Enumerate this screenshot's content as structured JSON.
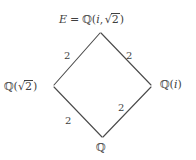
{
  "diagram": {
    "kind": "hasse-lattice",
    "title": "",
    "background_color": "#ffffff",
    "line_color": "#4a4a4a",
    "text_color": "#3f3f3f",
    "nodes": [
      {
        "id": "top",
        "role": "top-field",
        "text": "E = ℚ(i, √2)",
        "x": 100,
        "y": 31
      },
      {
        "id": "left",
        "role": "intermediate-field-left",
        "text": "ℚ(√2)",
        "x": 53,
        "y": 86
      },
      {
        "id": "right",
        "role": "intermediate-field-right",
        "text": "ℚ(i)",
        "x": 152,
        "y": 86
      },
      {
        "id": "bottom",
        "role": "base-field",
        "text": "ℚ",
        "x": 103,
        "y": 138
      }
    ],
    "edges": [
      {
        "id": "top-left",
        "from": "left",
        "to": "top",
        "label": "2"
      },
      {
        "id": "top-right",
        "from": "right",
        "to": "top",
        "label": "2"
      },
      {
        "id": "bottom-right",
        "from": "bottom",
        "to": "right",
        "label": "2"
      },
      {
        "id": "bottom-left",
        "from": "bottom",
        "to": "left",
        "label": "2"
      }
    ],
    "labels": {
      "top_E": "E",
      "top_equals": "=",
      "top_Q": "ℚ",
      "top_open": "(",
      "top_i": "i",
      "top_comma": ",",
      "top_sqrt_sign": "√",
      "top_radicand": "2",
      "top_close": ")",
      "left_Q": "ℚ",
      "left_open": "(",
      "left_sqrt_sign": "√",
      "left_radicand": "2",
      "left_close": ")",
      "right_Q": "ℚ",
      "right_open": "(",
      "right_i": "i",
      "right_close": ")",
      "bottom_Q": "ℚ",
      "edge_top_left": "2",
      "edge_top_right": "2",
      "edge_bottom_right": "2",
      "edge_bottom_left": "2"
    }
  }
}
